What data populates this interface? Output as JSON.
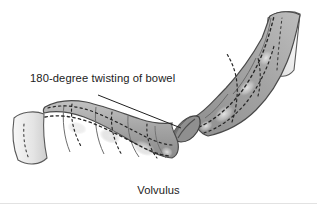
{
  "figure": {
    "caption": "Volvulus",
    "callout_label": "180-degree twisting of bowel",
    "background_color": "#ffffff",
    "text_color": "#1c1c1c",
    "rule_color": "#e2e2e2"
  },
  "illustration": {
    "subject": "volvulus-bowel-loop",
    "style": "grayscale-line-drawing",
    "outline_color": "#3f3f3f",
    "dash_color": "#2b2b2b",
    "fill_dark": "#8d8d8d",
    "fill_mid": "#a9a9a9",
    "fill_light": "#c9c9c9",
    "fill_pale": "#ececec",
    "highlight_color": "#dcdcdc",
    "twist_point": {
      "x": 182,
      "y": 129
    },
    "leader_line": {
      "x1": 98,
      "y1": 95,
      "x2": 181,
      "y2": 128
    },
    "segments": [
      {
        "name": "proximal-cut-end",
        "shade": "#ececec"
      },
      {
        "name": "lower-limb-haustra",
        "shade": "#a9a9a9"
      },
      {
        "name": "torsion-neck",
        "shade": "#8d8d8d"
      },
      {
        "name": "upper-limb-haustra",
        "shade": "#9a9a9a"
      },
      {
        "name": "distal-cut-end",
        "shade": "#f2f2f2"
      }
    ]
  }
}
